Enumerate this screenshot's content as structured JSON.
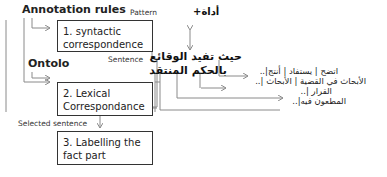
{
  "diagram": {
    "headings": {
      "annotation_rules": "Annotation rules",
      "ontolo": "Ontolo"
    },
    "labels": {
      "pattern": "Pattern",
      "sentence": "Sentence",
      "selected_sentence": "Selected sentence"
    },
    "steps": [
      {
        "label": "1. syntactic correspondence"
      },
      {
        "label": "2. Lexical Correspondance"
      },
      {
        "label": "3. Labelling the fact part"
      }
    ],
    "arabic": {
      "tool": "أداة+",
      "sentence_line1": "حيث تفيد الوقائع",
      "sentence_line2": "بالحكم المنتقد",
      "result_line1": "اتضح | يستفاد | أنتج|..",
      "result_line2": "الأبحاث في القضية | الأبحاث |..",
      "result_line3": "القرار |..",
      "result_line4": "المطعون فيه|.."
    },
    "colors": {
      "line": "#8a8a8a",
      "box_border": "#333333",
      "text": "#222222"
    }
  }
}
